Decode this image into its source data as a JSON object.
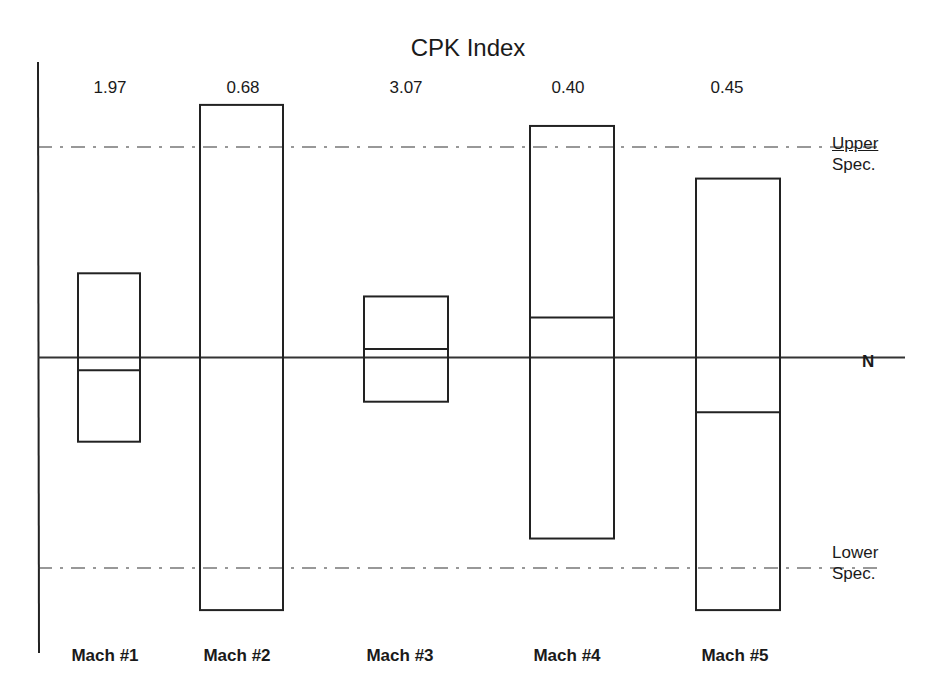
{
  "title": "CPK Index",
  "labels": {
    "upper_spec": [
      "Upper",
      "Spec."
    ],
    "lower_spec": [
      "Lower",
      "Spec."
    ],
    "nominal": "N"
  },
  "chart_data": {
    "type": "box",
    "title": "CPK Index",
    "xlabel": "",
    "ylabel": "",
    "categories": [
      "Mach #1",
      "Mach #2",
      "Mach #3",
      "Mach #4",
      "Mach #5"
    ],
    "cpk_values": [
      "1.97",
      "0.68",
      "3.07",
      "0.40",
      "0.45"
    ],
    "reference_lines": [
      {
        "name": "Upper Spec.",
        "value": 1.0,
        "style": "dash-dot"
      },
      {
        "name": "N",
        "value": 0.0,
        "style": "solid"
      },
      {
        "name": "Lower Spec.",
        "value": -1.0,
        "style": "dash-dot"
      }
    ],
    "boxes": [
      {
        "name": "Mach #1",
        "top": 0.4,
        "mid": -0.06,
        "bottom": -0.4
      },
      {
        "name": "Mach #2",
        "top": 1.2,
        "mid": null,
        "bottom": -1.2
      },
      {
        "name": "Mach #3",
        "top": 0.29,
        "mid": 0.04,
        "bottom": -0.21
      },
      {
        "name": "Mach #4",
        "top": 1.1,
        "mid": 0.19,
        "bottom": -0.86
      },
      {
        "name": "Mach #5",
        "top": 0.85,
        "mid": -0.26,
        "bottom": -1.2
      }
    ],
    "ylim": [
      -1.4,
      1.4
    ],
    "grid": false,
    "legend": "none"
  }
}
